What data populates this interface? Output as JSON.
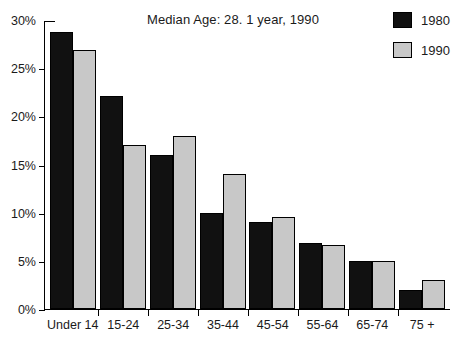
{
  "chart_data": {
    "type": "bar",
    "title": "Median Age: 28. 1 year, 1990",
    "xlabel": "",
    "ylabel": "",
    "ylim": [
      0,
      30
    ],
    "ytick_values": [
      0,
      5,
      10,
      15,
      20,
      25,
      30
    ],
    "ytick_labels": [
      "0%",
      "5%",
      "10%",
      "15%",
      "20%",
      "25%",
      "30%"
    ],
    "grid": false,
    "legend_position": "top-right",
    "categories": [
      "Under 14",
      "15-24",
      "25-34",
      "35-44",
      "45-54",
      "55-64",
      "65-74",
      "75 +"
    ],
    "series": [
      {
        "name": "1980",
        "color": "#111111",
        "values": [
          28.8,
          22.1,
          16.0,
          10.0,
          9.0,
          6.9,
          5.0,
          2.0
        ]
      },
      {
        "name": "1990",
        "color": "#c8c8c8",
        "values": [
          26.9,
          17.0,
          18.0,
          14.0,
          9.6,
          6.6,
          5.0,
          3.0
        ]
      }
    ]
  },
  "legend": {
    "entries": [
      {
        "label": "1980",
        "color": "#111111"
      },
      {
        "label": "1990",
        "color": "#c8c8c8"
      }
    ]
  }
}
